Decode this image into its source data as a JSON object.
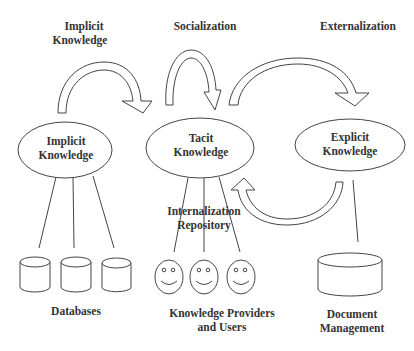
{
  "top_labels": {
    "implicit_knowledge": [
      "Implicit",
      "Knowledge"
    ],
    "socialization": "Socialization",
    "externalization": "Externalization"
  },
  "nodes": {
    "implicit": [
      "Implicit",
      "Knowledge"
    ],
    "tacit": [
      "Tacit",
      "Knowledge"
    ],
    "explicit": [
      "Explicit",
      "Knowledge"
    ]
  },
  "internalization": [
    "Internalization",
    "Repository"
  ],
  "bottom_labels": {
    "databases": "Databases",
    "providers": [
      "Knowledge Providers",
      "and Users"
    ],
    "document_management": [
      "Document",
      "Management"
    ]
  },
  "icons": {
    "databases": [
      "database-icon",
      "database-icon",
      "database-icon"
    ],
    "people": [
      "smiley-face-icon",
      "smiley-face-icon",
      "smiley-face-icon"
    ],
    "document_store": "database-icon"
  }
}
